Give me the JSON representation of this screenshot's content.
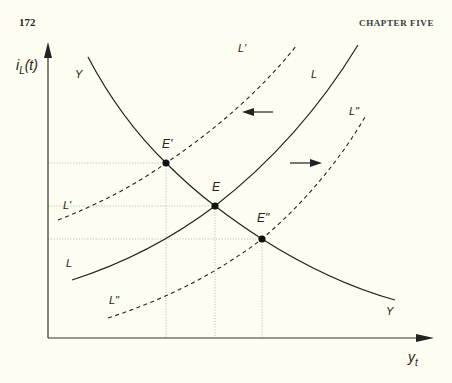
{
  "header": {
    "page_number": "172",
    "chapter_title": "CHAPTER FIVE"
  },
  "figure": {
    "y_axis_label_main": "i",
    "y_axis_label_sub": "L",
    "y_axis_label_tail": "(t)",
    "x_axis_label_main": "y",
    "x_axis_label_sub": "t",
    "curves": {
      "Y_top": "Y",
      "Y_bottom": "Y",
      "L_top": "L",
      "L_bottom": "L",
      "L1_top": "L'",
      "L1_left": "L'",
      "L2_top": "L\"",
      "L2_bottom": "L\""
    },
    "points": {
      "E1": "E'",
      "E": "E",
      "E2": "E\""
    },
    "arrows": {
      "left": "shift-left",
      "right": "shift-right"
    },
    "colors": {
      "ink": "#222222",
      "guide": "#9a9a8a",
      "background": "#fdfdf1"
    }
  }
}
